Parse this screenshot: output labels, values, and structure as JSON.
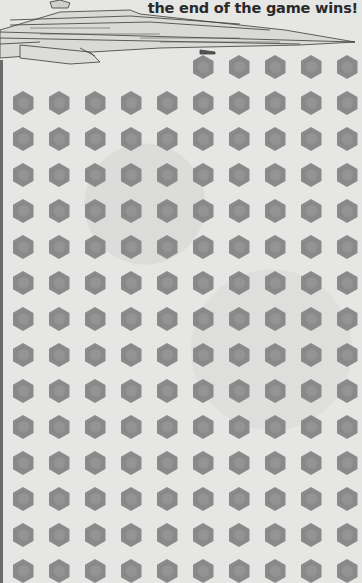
{
  "caption": "the end of the game wins!",
  "colors": {
    "background": "#e6e6e4",
    "hex": "#8a8a8a",
    "text": "#2a2a2a"
  },
  "grid": {
    "hex_icon": "hexagon-icon",
    "first_row": {
      "y": 67,
      "x": [
        203,
        239,
        275,
        311,
        347
      ]
    },
    "rows_y": [
      103,
      139,
      175,
      211,
      247,
      283,
      319,
      355,
      391,
      427,
      463,
      499,
      535,
      571
    ],
    "cols_x": [
      23,
      59,
      95,
      131,
      167,
      203,
      239,
      275,
      311,
      347
    ]
  }
}
